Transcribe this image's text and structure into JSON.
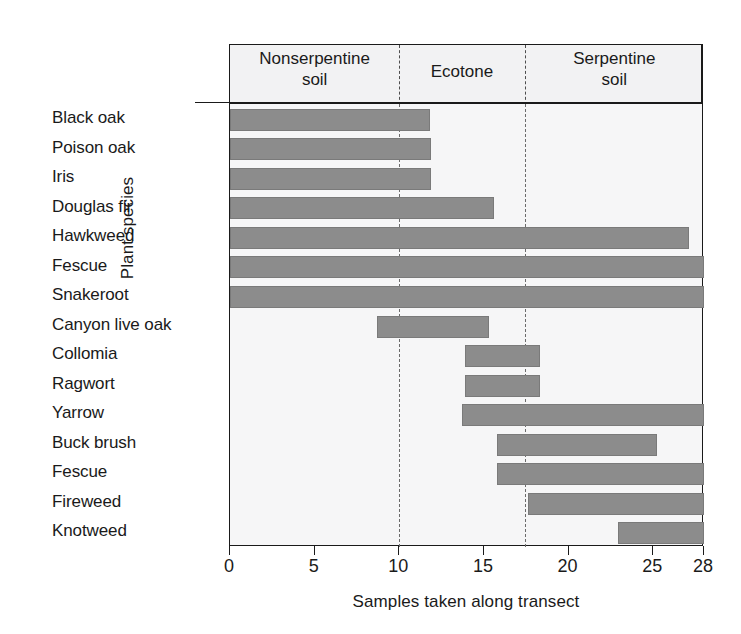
{
  "chart_data": {
    "type": "bar",
    "orientation": "horizontal",
    "title": "",
    "xlabel": "Samples taken along transect",
    "ylabel": "Plant species",
    "xlim": [
      0,
      28
    ],
    "xticks": [
      0,
      5,
      10,
      15,
      20,
      25,
      28
    ],
    "xticklabels": [
      "0",
      "5",
      "10",
      "15",
      "20",
      "25",
      "28"
    ],
    "grid": false,
    "legend": null,
    "categories": [
      "Black oak",
      "Poison oak",
      "Iris",
      "Douglas fir",
      "Hawkweed",
      "Fescue",
      "Snakeroot",
      "Canyon live oak",
      "Collomia",
      "Ragwort",
      "Yarrow",
      "Buck brush",
      "Fescue",
      "Fireweed",
      "Knotweed"
    ],
    "bars": [
      {
        "category": "Black oak",
        "start": 0.0,
        "end": 11.8
      },
      {
        "category": "Poison oak",
        "start": 0.0,
        "end": 11.9
      },
      {
        "category": "Iris",
        "start": 0.0,
        "end": 11.9
      },
      {
        "category": "Douglas fir",
        "start": 0.0,
        "end": 15.6
      },
      {
        "category": "Hawkweed",
        "start": 0.0,
        "end": 27.1
      },
      {
        "category": "Fescue",
        "start": 0.0,
        "end": 28.0
      },
      {
        "category": "Snakeroot",
        "start": 0.0,
        "end": 28.0
      },
      {
        "category": "Canyon live oak",
        "start": 8.7,
        "end": 15.3
      },
      {
        "category": "Collomia",
        "start": 13.9,
        "end": 18.3
      },
      {
        "category": "Ragwort",
        "start": 13.9,
        "end": 18.3
      },
      {
        "category": "Yarrow",
        "start": 13.7,
        "end": 28.0
      },
      {
        "category": "Buck brush",
        "start": 15.8,
        "end": 25.2
      },
      {
        "category": "Fescue",
        "start": 15.8,
        "end": 28.0
      },
      {
        "category": "Fireweed",
        "start": 17.6,
        "end": 28.0
      },
      {
        "category": "Knotweed",
        "start": 22.9,
        "end": 28.0
      }
    ],
    "zones": [
      {
        "name": "nonserpentine",
        "label": "Nonserpentine\nsoil",
        "start": 0.0,
        "end": 10.0
      },
      {
        "name": "ecotone",
        "label": "Ecotone",
        "start": 10.0,
        "end": 17.4
      },
      {
        "name": "serpentine",
        "label": "Serpentine\nsoil",
        "start": 17.4,
        "end": 28.0
      }
    ],
    "zone_dividers": [
      10.0,
      17.4
    ],
    "colors": {
      "bar_fill": "#8c8c8c",
      "bar_edge": "#7a7a7a",
      "plot_background": "#f6f6f7",
      "header_background": "#f2f2f3",
      "axis": "#1a1a1a",
      "divider": "#6b6b6b"
    }
  },
  "zone_labels": {
    "nonserpentine_line1": "Nonserpentine",
    "nonserpentine_line2": "soil",
    "ecotone": "Ecotone",
    "serpentine_line1": "Serpentine",
    "serpentine_line2": "soil"
  }
}
